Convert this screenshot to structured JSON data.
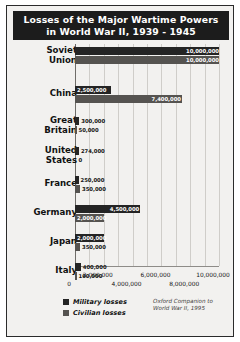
{
  "title": "Losses of the Major Wartime Powers in World War II, 1939 - 1945",
  "title_line1": "Losses of the Major Wartime Powers",
  "title_line2": "in World War II, 1939 - 1945",
  "legend": {
    "military_label": "Military losses",
    "civilian_label": "Civilian losses",
    "military_color": "#242424",
    "civilian_color": "#555350"
  },
  "source": {
    "line1": "Oxford Companion to",
    "line2": "World War II, 1995"
  },
  "chart_data": {
    "type": "bar",
    "orientation": "horizontal",
    "title": "Losses of the Major Wartime Powers in World War II, 1939 - 1945",
    "xlabel": "",
    "ylabel": "",
    "xlim": [
      0,
      10000000
    ],
    "grid": true,
    "grid_interval": 1000000,
    "legend_position": "bottom-left",
    "categories": [
      "Soviet Union",
      "China",
      "Great Britain",
      "United States",
      "France",
      "Germany",
      "Japan",
      "Italy"
    ],
    "series": [
      {
        "name": "Military losses",
        "color": "#242424",
        "values": [
          10000000,
          2500000,
          300000,
          274000,
          250000,
          4500000,
          2000000,
          400000
        ],
        "labels": [
          "10,000,000",
          "2,500,000",
          "300,000",
          "274,000",
          "250,000",
          "4,500,000",
          "2,000,000",
          "400,000"
        ]
      },
      {
        "name": "Civilian losses",
        "color": "#555350",
        "values": [
          10000000,
          7400000,
          50000,
          0,
          350000,
          2000000,
          350000,
          100000
        ],
        "labels": [
          "10,000,000",
          "7,400,000",
          "50,000",
          "0",
          "350,000",
          "2,000,000",
          "350,000",
          "100,000"
        ]
      }
    ],
    "xticks": [
      0,
      2000000,
      4000000,
      6000000,
      8000000,
      10000000
    ],
    "xticklabels": [
      "0",
      "2,000,000",
      "4,000,000",
      "6,000,000",
      "8,000,000",
      "10,000,000"
    ],
    "source": "Oxford Companion to World War II, 1995"
  },
  "rows": [
    {
      "label_line1": "Soviet",
      "label_line2": "Union",
      "mil": {
        "label": "10,000,000",
        "pct": 100,
        "inside": true
      },
      "civ": {
        "label": "10,000,000",
        "pct": 100,
        "inside": true
      }
    },
    {
      "label_line1": "China",
      "label_line2": "",
      "mil": {
        "label": "2,500,000",
        "pct": 25,
        "inside": true
      },
      "civ": {
        "label": "7,400,000",
        "pct": 74,
        "inside": true
      }
    },
    {
      "label_line1": "Great",
      "label_line2": "Britain",
      "mil": {
        "label": "300,000",
        "pct": 3,
        "inside": false
      },
      "civ": {
        "label": "50,000",
        "pct": 0.5,
        "inside": false
      }
    },
    {
      "label_line1": "United",
      "label_line2": "States",
      "mil": {
        "label": "274,000",
        "pct": 2.74,
        "inside": false
      },
      "civ": {
        "label": "0",
        "pct": 0,
        "inside": false
      }
    },
    {
      "label_line1": "France",
      "label_line2": "",
      "mil": {
        "label": "250,000",
        "pct": 2.5,
        "inside": false
      },
      "civ": {
        "label": "350,000",
        "pct": 3.5,
        "inside": false
      }
    },
    {
      "label_line1": "Germany",
      "label_line2": "",
      "mil": {
        "label": "4,500,000",
        "pct": 45,
        "inside": true
      },
      "civ": {
        "label": "2,000,000",
        "pct": 20,
        "inside": true
      }
    },
    {
      "label_line1": "Japan",
      "label_line2": "",
      "mil": {
        "label": "2,000,000",
        "pct": 20,
        "inside": true
      },
      "civ": {
        "label": "350,000",
        "pct": 3.5,
        "inside": false
      }
    },
    {
      "label_line1": "Italy",
      "label_line2": "",
      "mil": {
        "label": "400,000",
        "pct": 4,
        "inside": false
      },
      "civ": {
        "label": "100,000",
        "pct": 1,
        "inside": false
      }
    }
  ]
}
